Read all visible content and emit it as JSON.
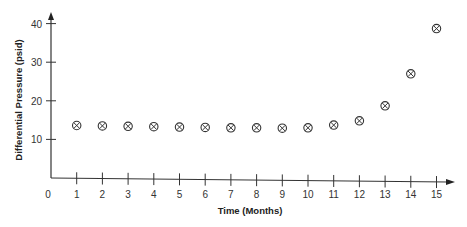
{
  "chart_data": {
    "type": "scatter",
    "title": "",
    "xlabel": "Time (Months)",
    "ylabel": "Differential Pressure (psid)",
    "x_ticks": [
      0,
      1,
      2,
      3,
      4,
      5,
      6,
      7,
      8,
      9,
      10,
      11,
      12,
      13,
      14,
      15
    ],
    "y_ticks": [
      10,
      20,
      30,
      40
    ],
    "xlim": [
      0,
      15.5
    ],
    "ylim": [
      0,
      42
    ],
    "grid": false,
    "legend": null,
    "marker": "circle-x",
    "series": [
      {
        "name": "Differential Pressure",
        "x": [
          1,
          2,
          3,
          4,
          5,
          6,
          7,
          8,
          9,
          10,
          11,
          12,
          13,
          14,
          15
        ],
        "y": [
          13.6,
          13.5,
          13.4,
          13.3,
          13.2,
          13.1,
          13.0,
          13.0,
          12.9,
          13.0,
          13.7,
          14.8,
          18.7,
          27.0,
          38.7
        ]
      }
    ]
  }
}
